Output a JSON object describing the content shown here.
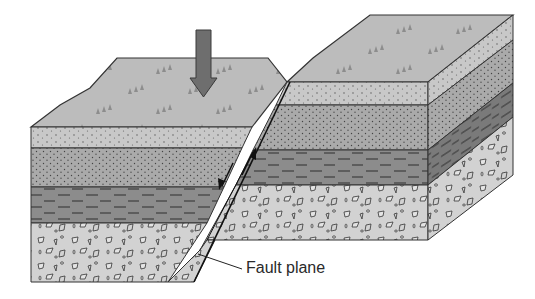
{
  "diagram": {
    "labels": {
      "fault_plane": "Fault plane"
    },
    "annotations": {
      "compression_arrow": "down-arrow",
      "slip_arrows": [
        "down-half-arrow",
        "up-half-arrow"
      ]
    },
    "layers": [
      {
        "name": "surface",
        "pattern": "grass-trees",
        "color": "#b9b9b9"
      },
      {
        "name": "layer-1",
        "pattern": "sparse-dots",
        "color": "#c6c6c6"
      },
      {
        "name": "layer-2",
        "pattern": "dense-dots",
        "color": "#a9a9a9"
      },
      {
        "name": "layer-3",
        "pattern": "dashes",
        "color": "#8a8a8a"
      },
      {
        "name": "layer-4",
        "pattern": "rock-fragments",
        "color": "#d0d0d0"
      }
    ]
  }
}
